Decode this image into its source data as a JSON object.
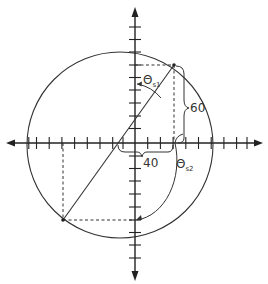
{
  "diagram": {
    "labels": {
      "theta_s1_main": "Θ",
      "theta_s1_sub": "s1",
      "theta_s2_main": "Θ",
      "theta_s2_sub": "s2",
      "dim_vertical": "60",
      "dim_horizontal": "40"
    },
    "axes": {
      "origin_px": [
        135,
        143
      ],
      "tick_spacing_px": 12.7,
      "x_ticks_left": 8,
      "x_ticks_right": 8,
      "y_ticks_up": 9,
      "y_ticks_down": 9
    },
    "circle": {
      "center_px": [
        120,
        145
      ],
      "radius_px": 93
    },
    "points": {
      "upper_right": [
        174,
        65
      ],
      "lower_left": [
        63,
        220
      ]
    },
    "colors": {
      "line": "#333333",
      "background": "#ffffff"
    }
  }
}
